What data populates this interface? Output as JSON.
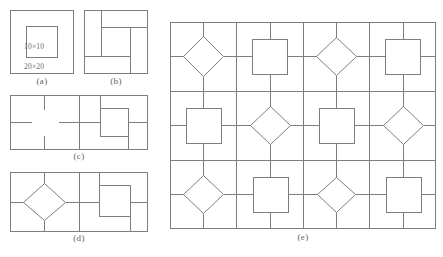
{
  "figure": {
    "kind": "geometry-tiling-diagram",
    "background_color": "#ffffff",
    "line_color": "#7d7d7d",
    "text_color": "#5e5e5e",
    "panels": [
      {
        "id": "a",
        "caption": "(a)",
        "description": "single cell: outer square with concentric inner square",
        "labels": {
          "inner": "10×10",
          "outer": "20×20"
        }
      },
      {
        "id": "b",
        "caption": "(b)",
        "description": "single cell: centered square with four connector lines to cell border"
      },
      {
        "id": "c",
        "caption": "(c)",
        "description": "two cells wide: left cell degenerate square (cross stubs), right cell centered square"
      },
      {
        "id": "d",
        "caption": "(d)",
        "description": "two cells wide: left cell diamond, right cell upright square"
      },
      {
        "id": "e",
        "caption": "(e)",
        "description": "four columns by three rows, alternating diamond and square per cell",
        "grid": {
          "columns": 4,
          "rows": 3,
          "pattern": [
            [
              "diamond",
              "square",
              "diamond",
              "square"
            ],
            [
              "square",
              "diamond",
              "square",
              "diamond"
            ],
            [
              "diamond",
              "square",
              "diamond",
              "square"
            ]
          ]
        }
      }
    ]
  }
}
